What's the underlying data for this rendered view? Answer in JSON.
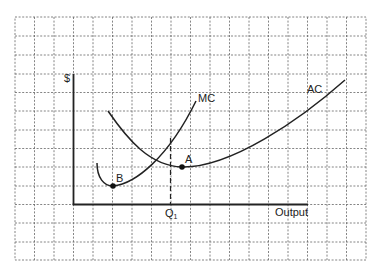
{
  "diagram": {
    "type": "cost-curves",
    "y_axis_label": "$",
    "x_axis_label": "Output",
    "quantity_label": "Q",
    "quantity_subscript": "1",
    "curves": [
      {
        "name": "MC",
        "label": "MC",
        "description": "Marginal cost curve, U-shaped, minimum at point B, rising steeply and crossing AC at its minimum"
      },
      {
        "name": "AC",
        "label": "AC",
        "description": "Average cost curve, U-shaped, minimum at point A"
      }
    ],
    "points": [
      {
        "label": "A",
        "description": "Minimum of AC curve"
      },
      {
        "label": "B",
        "description": "Minimum of MC curve"
      }
    ],
    "colors": {
      "grid": "#555555",
      "axes": "#222222",
      "curves": "#222222"
    }
  }
}
